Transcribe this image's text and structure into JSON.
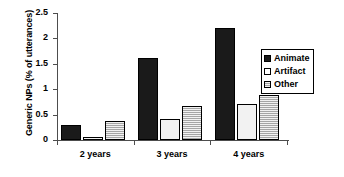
{
  "chart_data": {
    "type": "bar",
    "title": "",
    "xlabel": "",
    "ylabel": "Generic NPs (% of utterances)",
    "categories": [
      "2 years",
      "3 years",
      "4 years"
    ],
    "series": [
      {
        "name": "Animate",
        "values": [
          0.3,
          1.62,
          2.2
        ]
      },
      {
        "name": "Artifact",
        "values": [
          0.05,
          0.42,
          0.7
        ]
      },
      {
        "name": "Other",
        "values": [
          0.37,
          0.66,
          0.89
        ]
      }
    ],
    "ylim": [
      0,
      2.5
    ],
    "ytick_labels": [
      "0",
      "0.5",
      "1",
      "1.5",
      "2",
      "2.5"
    ],
    "ytick_values": [
      0,
      0.5,
      1,
      1.5,
      2,
      2.5
    ],
    "grid": false,
    "legend_position": "top-right",
    "colors": {
      "animate": "#1a1a1a",
      "artifact": "#f2f2f2",
      "other": "#a6a6a6",
      "axis": "#4d4d4d",
      "text": "#000000",
      "background": "#ffffff"
    }
  },
  "legend": {
    "items": [
      {
        "label": "Animate",
        "swatch": "black-square-swatch"
      },
      {
        "label": "Artifact",
        "swatch": "white-square-swatch"
      },
      {
        "label": "Other",
        "swatch": "hatched-square-swatch"
      }
    ]
  }
}
